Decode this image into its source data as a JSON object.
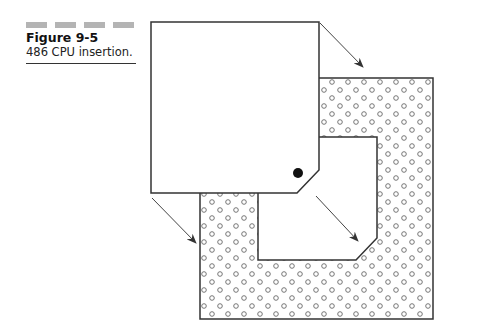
{
  "figure": {
    "number_label": "Figure 9-5",
    "caption": "486 CPU insertion.",
    "header_bar_count": 4,
    "header_bar_color": "#b4b4b4"
  },
  "diagram": {
    "elements": [
      {
        "name": "cpu-chip",
        "shape": "square with chamfered bottom-right corner",
        "pin1_marker": "filled dot near chamfered corner"
      },
      {
        "name": "cpu-socket",
        "shape": "square frame with pin holes and an open center with chamfered corner"
      },
      {
        "name": "insertion-arrows",
        "count": 3,
        "direction": "down-right"
      }
    ],
    "stroke_color": "#333333",
    "pin1_dot_color": "#111111",
    "pin_hole_color": "#666666"
  }
}
